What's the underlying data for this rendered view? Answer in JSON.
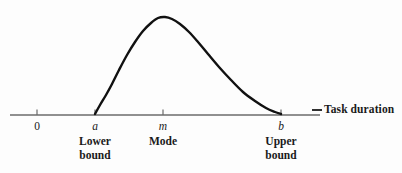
{
  "figure": {
    "background_color": "#fdfdfd",
    "axis_color": "#6b6b6b",
    "curve_color": "#111111",
    "text_color": "#1a1a1a"
  },
  "axis": {
    "name_label": "Task duration",
    "origin_label": "0",
    "lower_symbol": "a",
    "mode_symbol": "m",
    "upper_symbol": "b",
    "lower_bound_label": "Lower\nbound",
    "mode_label": "Mode",
    "upper_bound_label": "Upper\nbound"
  },
  "chart_data": {
    "type": "line",
    "title": "",
    "xlabel": "Task duration",
    "ylabel": "",
    "grid": false,
    "legend": "none",
    "axis_ticks": [
      {
        "symbol": "0",
        "x_px": 37,
        "label": ""
      },
      {
        "symbol": "a",
        "x_px": 95,
        "label": "Lower bound"
      },
      {
        "symbol": "m",
        "x_px": 163,
        "label": "Mode"
      },
      {
        "symbol": "b",
        "x_px": 281,
        "label": "Upper bound"
      }
    ],
    "axis_line": {
      "x_start_px": 10,
      "x_end_px": 320,
      "y_px": 115
    },
    "series": [
      {
        "name": "Beta probability density",
        "description": "Right-skewed unimodal density starting at a, peaking at m, returning to zero at b",
        "points_px": [
          [
            95,
            114
          ],
          [
            100,
            105
          ],
          [
            106,
            95
          ],
          [
            112,
            84
          ],
          [
            119,
            70
          ],
          [
            127,
            55
          ],
          [
            135,
            42
          ],
          [
            143,
            31
          ],
          [
            151,
            23
          ],
          [
            158,
            18
          ],
          [
            165,
            17
          ],
          [
            172,
            19
          ],
          [
            180,
            24
          ],
          [
            189,
            32
          ],
          [
            198,
            42
          ],
          [
            208,
            54
          ],
          [
            219,
            67
          ],
          [
            231,
            80
          ],
          [
            243,
            92
          ],
          [
            255,
            101
          ],
          [
            266,
            108
          ],
          [
            275,
            112
          ],
          [
            281,
            114
          ]
        ]
      }
    ],
    "peak": {
      "x_symbol": "m",
      "x_px": 163,
      "y_px": 17
    },
    "support": {
      "from_symbol": "a",
      "to_symbol": "b"
    }
  }
}
